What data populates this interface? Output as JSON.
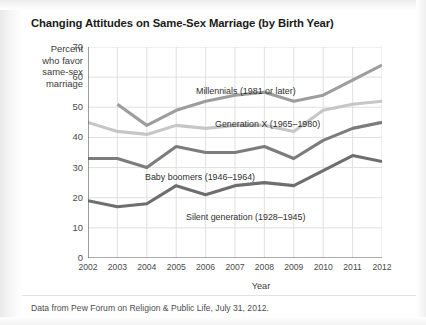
{
  "title": "Changing Attitudes on Same-Sex Marriage (by Birth Year)",
  "axis_label_y_lines": [
    "Percent",
    "who favor",
    "same-sex",
    "marriage"
  ],
  "axis_label_x": "Year",
  "source_note": "Data from Pew Forum on Religion & Public Life, July 31, 2012.",
  "chart_data": {
    "type": "line",
    "title": "Changing Attitudes on Same-Sex Marriage (by Birth Year)",
    "xlabel": "Year",
    "ylabel": "Percent who favor same-sex marriage",
    "x": [
      2002,
      2003,
      2004,
      2005,
      2006,
      2007,
      2008,
      2009,
      2010,
      2011,
      2012
    ],
    "xtick_labels": [
      "2002",
      "2003",
      "2004",
      "2005",
      "2006",
      "2007",
      "2008",
      "2009",
      "2010",
      "2011",
      "2012"
    ],
    "ytick_labels": [
      "0",
      "10",
      "20",
      "30",
      "40",
      "50",
      "60",
      "70"
    ],
    "yticks": [
      0,
      10,
      20,
      30,
      40,
      50,
      60,
      70
    ],
    "xlim": [
      2002,
      2012
    ],
    "ylim": [
      0,
      70
    ],
    "grid": true,
    "legend": "inline-labels",
    "series": [
      {
        "name": "Millennials (1981 or later)",
        "label": "Millennials (1981 or later)",
        "color": "#9d9d9d",
        "x": [
          2003,
          2004,
          2005,
          2006,
          2007,
          2008,
          2009,
          2010,
          2011,
          2012
        ],
        "values": [
          51,
          44,
          49,
          52,
          54,
          55,
          52,
          54,
          59,
          64
        ]
      },
      {
        "name": "Generation X (1965-1980)",
        "label": "Generation X (1965–1980)",
        "color": "#c6c6c6",
        "x": [
          2002,
          2003,
          2004,
          2005,
          2006,
          2007,
          2008,
          2009,
          2010,
          2011,
          2012
        ],
        "values": [
          45,
          42,
          41,
          44,
          43,
          44,
          44,
          42,
          49,
          51,
          52
        ]
      },
      {
        "name": "Baby boomers (1946-1964)",
        "label": "Baby boomers (1946–1964)",
        "color": "#7c7c7c",
        "x": [
          2002,
          2003,
          2004,
          2005,
          2006,
          2007,
          2008,
          2009,
          2010,
          2011,
          2012
        ],
        "values": [
          33,
          33,
          30,
          37,
          35,
          35,
          37,
          33,
          39,
          43,
          45
        ]
      },
      {
        "name": "Silent generation (1928-1945)",
        "label": "Silent generation (1928–1945)",
        "color": "#6e6e6e",
        "x": [
          2002,
          2003,
          2004,
          2005,
          2006,
          2007,
          2008,
          2009,
          2010,
          2011,
          2012
        ],
        "values": [
          19,
          17,
          18,
          24,
          21,
          24,
          25,
          24,
          29,
          34,
          32
        ]
      }
    ],
    "series_label_positions": [
      {
        "series": 0,
        "x_px": 196,
        "y_px": 86
      },
      {
        "series": 1,
        "x_px": 215,
        "y_px": 119
      },
      {
        "series": 2,
        "x_px": 145,
        "y_px": 172
      },
      {
        "series": 3,
        "x_px": 186,
        "y_px": 212
      }
    ]
  }
}
